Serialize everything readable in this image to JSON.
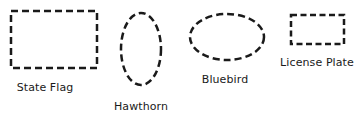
{
  "items": [
    {
      "label": "State Flag",
      "shape": "rectangle"
    },
    {
      "label": "Hawthorn",
      "shape": "ellipse-vertical"
    },
    {
      "label": "Bluebird",
      "shape": "ellipse-horizontal"
    },
    {
      "label": "License Plate",
      "shape": "rectangle-small"
    }
  ],
  "colors": {
    "stroke": "#1a1a1a",
    "background": "#ffffff"
  }
}
